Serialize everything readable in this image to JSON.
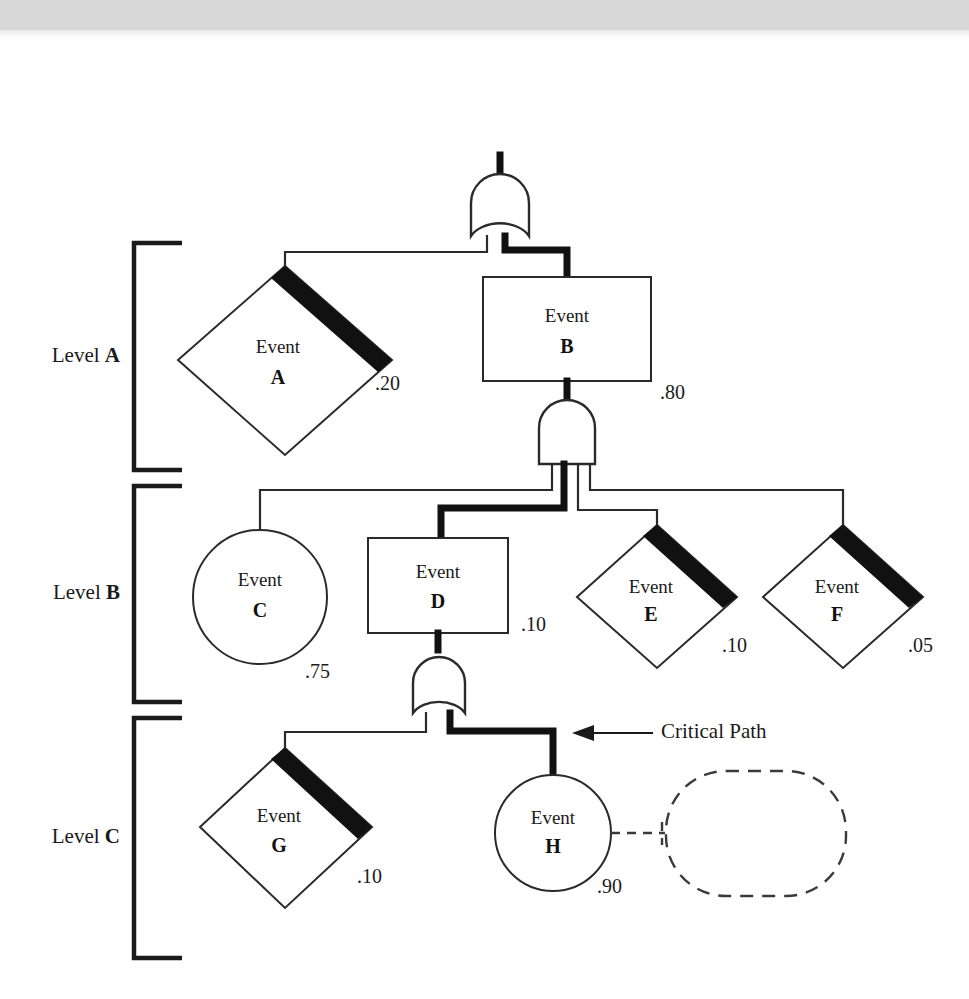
{
  "diagram": {
    "type": "fault-tree",
    "annotation": {
      "critical_path_label": "Critical Path"
    },
    "levels": [
      {
        "id": "A",
        "prefix": "Level ",
        "name": "A"
      },
      {
        "id": "B",
        "prefix": "Level ",
        "name": "B"
      },
      {
        "id": "C",
        "prefix": "Level ",
        "name": "C"
      }
    ],
    "nodes": [
      {
        "key": "T",
        "label": "Top Event",
        "id": "T",
        "shape": "rectangle",
        "probability": "",
        "level": "top"
      },
      {
        "key": "A",
        "label": "Event",
        "id": "A",
        "shape": "diamond-barred",
        "probability": ".20",
        "level": "A"
      },
      {
        "key": "B",
        "label": "Event",
        "id": "B",
        "shape": "rectangle",
        "probability": ".80",
        "level": "A"
      },
      {
        "key": "C",
        "label": "Event",
        "id": "C",
        "shape": "circle",
        "probability": ".75",
        "level": "B"
      },
      {
        "key": "D",
        "label": "Event",
        "id": "D",
        "shape": "rectangle",
        "probability": ".10",
        "level": "B"
      },
      {
        "key": "E",
        "label": "Event",
        "id": "E",
        "shape": "diamond-barred",
        "probability": ".10",
        "level": "B"
      },
      {
        "key": "F",
        "label": "Event",
        "id": "F",
        "shape": "diamond-barred",
        "probability": ".05",
        "level": "B"
      },
      {
        "key": "G",
        "label": "Event",
        "id": "G",
        "shape": "diamond-barred",
        "probability": ".10",
        "level": "C"
      },
      {
        "key": "H",
        "label": "Event",
        "id": "H",
        "shape": "circle",
        "probability": ".90",
        "level": "C"
      },
      {
        "key": "placeholder",
        "label": "",
        "id": "",
        "shape": "dashed-rounded-rect",
        "probability": "",
        "level": "C"
      }
    ],
    "gates": [
      {
        "key": "gate-T",
        "type": "OR",
        "output": "T",
        "inputs": [
          "A",
          "B"
        ]
      },
      {
        "key": "gate-B",
        "type": "AND",
        "output": "B",
        "inputs": [
          "C",
          "D",
          "E",
          "F"
        ]
      },
      {
        "key": "gate-D",
        "type": "OR",
        "output": "D",
        "inputs": [
          "G",
          "H"
        ]
      }
    ],
    "critical_path": [
      "T",
      "B",
      "D",
      "H"
    ],
    "colors": {
      "line": "#2a2a2a",
      "critical": "#111111",
      "fill": "#ffffff",
      "bar": "#111111",
      "band": "#d7d7d7"
    }
  }
}
